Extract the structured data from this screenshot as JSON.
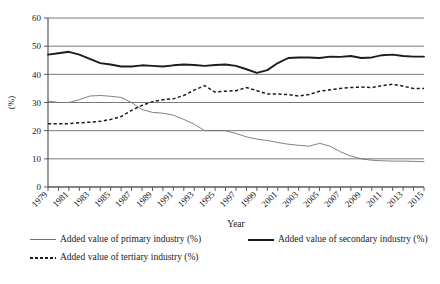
{
  "chart_data": {
    "type": "line",
    "title": "",
    "xlabel": "Year",
    "ylabel": "(%)",
    "ylim": [
      0,
      60
    ],
    "yticks": [
      0,
      10,
      20,
      30,
      40,
      50,
      60
    ],
    "grid": true,
    "legend_position": "bottom",
    "x": [
      1979,
      1980,
      1981,
      1982,
      1983,
      1984,
      1985,
      1986,
      1987,
      1988,
      1989,
      1990,
      1991,
      1992,
      1993,
      1994,
      1995,
      1996,
      1997,
      1998,
      1999,
      2000,
      2001,
      2002,
      2003,
      2004,
      2005,
      2006,
      2007,
      2008,
      2009,
      2010,
      2011,
      2012,
      2013,
      2014,
      2015
    ],
    "xtick_labels": [
      "1979",
      "1981",
      "1983",
      "1985",
      "1987",
      "1989",
      "1991",
      "1993",
      "1995",
      "1997",
      "1999",
      "2001",
      "2003",
      "2005",
      "2007",
      "2009",
      "2011",
      "2013",
      "2015"
    ],
    "series": [
      {
        "name": "Added value of primary industry (%)",
        "style": "thin-solid",
        "color": "#737373",
        "values": [
          30.5,
          30.0,
          30.0,
          31.0,
          32.3,
          32.5,
          32.2,
          31.8,
          30.0,
          27.5,
          26.5,
          26.2,
          25.5,
          24.0,
          22.3,
          20.0,
          20.0,
          20.0,
          19.0,
          17.8,
          17.0,
          16.5,
          15.8,
          15.2,
          14.8,
          14.5,
          15.5,
          14.5,
          12.5,
          11.0,
          10.0,
          9.5,
          9.3,
          9.2,
          9.2,
          9.1,
          9.0
        ]
      },
      {
        "name": "Added value of secondary industry (%)",
        "style": "thick-solid",
        "color": "#1c1c1c",
        "values": [
          47.0,
          47.5,
          48.0,
          47.0,
          45.5,
          44.0,
          43.5,
          42.8,
          42.8,
          43.2,
          43.0,
          42.8,
          43.2,
          43.5,
          43.3,
          43.0,
          43.3,
          43.5,
          43.0,
          41.8,
          40.5,
          41.5,
          44.0,
          45.8,
          46.0,
          46.0,
          45.8,
          46.3,
          46.2,
          46.5,
          45.8,
          46.0,
          46.8,
          47.0,
          46.5,
          46.3,
          46.3
        ]
      },
      {
        "name": "Added value of tertiary industry (%)",
        "style": "dashed",
        "color": "#1c1c1c",
        "values": [
          22.5,
          22.5,
          22.5,
          22.8,
          23.0,
          23.3,
          24.0,
          25.0,
          27.2,
          29.0,
          30.3,
          31.0,
          31.3,
          32.5,
          34.4,
          36.0,
          33.7,
          34.0,
          34.2,
          35.3,
          34.2,
          33.0,
          33.0,
          32.8,
          32.3,
          32.8,
          34.0,
          34.5,
          35.0,
          35.3,
          35.5,
          35.3,
          36.0,
          36.5,
          35.8,
          35.0,
          35.0
        ]
      }
    ]
  },
  "legend": {
    "entries": [
      {
        "label": "Added value of primary industry (%)",
        "style": "thin-solid"
      },
      {
        "label": "Added value of secondary industry (%)",
        "style": "thick-solid"
      },
      {
        "label": "Added value of tertiary industry (%)",
        "style": "dashed"
      }
    ]
  }
}
